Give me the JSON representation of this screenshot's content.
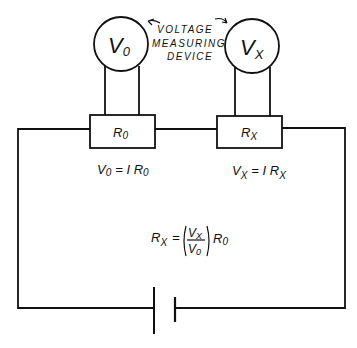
{
  "diagram": {
    "meters": [
      {
        "id": "v0",
        "label_main": "V",
        "label_sub": "0"
      },
      {
        "id": "vx",
        "label_main": "V",
        "label_sub": "X"
      }
    ],
    "annotation": {
      "line1": "VOLTAGE",
      "line2": "MEASURING",
      "line3": "DEVICE"
    },
    "resistors": [
      {
        "id": "r0",
        "label_main": "R",
        "label_sub": "0"
      },
      {
        "id": "rx",
        "label_main": "R",
        "label_sub": "X"
      }
    ],
    "equations": {
      "v0": {
        "lhs_main": "V",
        "lhs_sub": "0",
        "rhs": "= I R",
        "rhs_sub": "0"
      },
      "vx": {
        "lhs_main": "V",
        "lhs_sub": "X",
        "rhs": "= I R",
        "rhs_sub": "X"
      },
      "rx": {
        "lhs_main": "R",
        "lhs_sub": "X",
        "eq": "=",
        "num_main": "V",
        "num_sub": "X",
        "den_main": "V",
        "den_sub": "0",
        "tail_main": "R",
        "tail_sub": "0"
      }
    },
    "battery": {
      "label": "battery"
    }
  }
}
